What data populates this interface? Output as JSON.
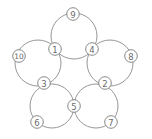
{
  "diagram": {
    "type": "five-circle-number-puzzle",
    "colors": {
      "background": "#ffffff",
      "line": "#8a8a8a",
      "node_border": "#7a7a7a",
      "text": "#6a6a6a"
    },
    "circles": [
      {
        "name": "top",
        "cx": 74,
        "cy": 36,
        "r": 23
      },
      {
        "name": "left",
        "cx": 38,
        "cy": 63,
        "r": 23
      },
      {
        "name": "right",
        "cx": 110,
        "cy": 63,
        "r": 23
      },
      {
        "name": "bottom-left",
        "cx": 52,
        "cy": 106,
        "r": 22
      },
      {
        "name": "bottom-right",
        "cx": 96,
        "cy": 106,
        "r": 22
      }
    ],
    "nodes": [
      {
        "label": "9",
        "x": 73,
        "y": 14
      },
      {
        "label": "1",
        "x": 55,
        "y": 49
      },
      {
        "label": "4",
        "x": 92,
        "y": 49
      },
      {
        "label": "10",
        "x": 19,
        "y": 56
      },
      {
        "label": "8",
        "x": 131,
        "y": 56
      },
      {
        "label": "3",
        "x": 44,
        "y": 83
      },
      {
        "label": "2",
        "x": 105,
        "y": 83
      },
      {
        "label": "5",
        "x": 74,
        "y": 106
      },
      {
        "label": "6",
        "x": 37,
        "y": 122
      },
      {
        "label": "7",
        "x": 111,
        "y": 122
      }
    ]
  }
}
